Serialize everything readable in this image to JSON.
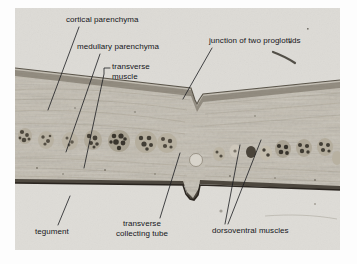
{
  "figure": {
    "kind": "micrograph",
    "caption_absent": true,
    "panel": {
      "background_color": "#d8d7d4",
      "border_color": "#b9b8b4"
    }
  },
  "colors": {
    "label_text": "#15161a",
    "leader_line": "#1b1c20",
    "page_background": "#ffffff",
    "tissue_light": "#c9c5bb",
    "tissue_mid": "#aea89c",
    "tissue_dark": "#7e7769",
    "tegument_line": "#2e2a24",
    "space_light": "#dbd9d5"
  },
  "labels": [
    {
      "id": "cortical-parenchyma",
      "text": "cortical parenchyma",
      "x": 66,
      "y": 20,
      "align": "left"
    },
    {
      "id": "medullary-parenchyma",
      "text": "medullary parenchyma",
      "x": 77,
      "y": 47,
      "align": "left"
    },
    {
      "id": "transverse-muscle",
      "text": "transverse\nmuscle",
      "line1": "transverse",
      "line2": "muscle",
      "x": 112,
      "y": 67,
      "align": "left"
    },
    {
      "id": "junction-of-two-proglottids",
      "text": "junction of two proglottids",
      "x": 209,
      "y": 41,
      "align": "left"
    },
    {
      "id": "tegument",
      "text": "tegument",
      "x": 35,
      "y": 232,
      "align": "left"
    },
    {
      "id": "transverse-collecting-tube",
      "line1": "transverse",
      "line2": "collecting tube",
      "text": "transverse\ncollecting tube",
      "x": 136,
      "y": 223,
      "align": "center"
    },
    {
      "id": "dorsoventral-muscles",
      "text": "dorsoventral muscles",
      "x": 212,
      "y": 231,
      "align": "left"
    }
  ],
  "leaders": [
    {
      "id": "leader-cortical-parenchyma",
      "x1": 79,
      "y1": 27,
      "x2": 48,
      "y2": 110
    },
    {
      "id": "leader-medullary-parenchyma",
      "x1": 100,
      "y1": 54,
      "x2": 66,
      "y2": 152
    },
    {
      "id": "leader-transverse-muscle",
      "x1": 110,
      "y1": 68,
      "x2": 104,
      "y2": 68,
      "x3": 104,
      "y3": 74,
      "x4": 84,
      "y4": 168
    },
    {
      "id": "leader-junction",
      "x1": 212,
      "y1": 48,
      "x2": 183,
      "y2": 99
    },
    {
      "id": "leader-tegument",
      "x1": 58,
      "y1": 225,
      "x2": 70,
      "y2": 196
    },
    {
      "id": "leader-collecting-tube",
      "x1": 160,
      "y1": 218,
      "x2": 180,
      "y2": 153
    },
    {
      "id": "leader-dorsoventral-a",
      "x1": 225,
      "y1": 224,
      "x2": 240,
      "y2": 145
    },
    {
      "id": "leader-dorsoventral-b",
      "x1": 228,
      "y1": 224,
      "x2": 261,
      "y2": 140
    }
  ],
  "structures": {
    "upper_space": "cortical parenchyma region above tissue band",
    "lower_space": "clear mounting medium below tegument",
    "notch": "junction of two proglottids V-notch near center",
    "collecting_tube": "pale round transverse collecting tube",
    "dorsoventral_muscle_bundles": 9
  }
}
